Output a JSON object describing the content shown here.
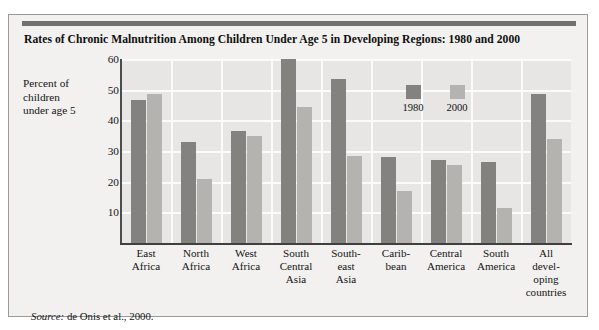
{
  "figure": {
    "title": "Rates of Chronic Malnutrition Among Children Under Age 5 in Developing Regions: 1980 and 2000",
    "y_axis_title_line1": "Percent of",
    "y_axis_title_line2": "children",
    "y_axis_title_line3": "under age 5",
    "source_lead": "Source:",
    "source_text": " de Onis et al., 2000."
  },
  "colors": {
    "series_1980": "#83827f",
    "series_2000": "#b4b3b0",
    "plot_background": "#e7e6e4",
    "figure_background": "#f2f1ef",
    "gridline": "#fbfbfa",
    "axis": "#3f3f3d",
    "top_rule": "#70706e"
  },
  "chart_data": {
    "type": "bar",
    "title": "Rates of Chronic Malnutrition Among Children Under Age 5 in Developing Regions: 1980 and 2000",
    "xlabel": "",
    "ylabel": "Percent of children under age 5",
    "ylim": [
      0,
      60
    ],
    "yticks": [
      10,
      20,
      30,
      40,
      50,
      60
    ],
    "ytick_labels": [
      "10",
      "20",
      "30",
      "40",
      "50",
      "60"
    ],
    "grid": true,
    "legend_position": "inside-upper-right",
    "categories": [
      "East Africa",
      "North Africa",
      "West Africa",
      "South Central Asia",
      "South-east Asia",
      "Caribbean",
      "Central America",
      "South America",
      "All developing countries"
    ],
    "category_label_lines": [
      [
        "East",
        "Africa"
      ],
      [
        "North",
        "Africa"
      ],
      [
        "West",
        "Africa"
      ],
      [
        "South",
        "Central",
        "Asia"
      ],
      [
        "South-",
        "east",
        "Asia"
      ],
      [
        "Carib-",
        "bean"
      ],
      [
        "Central",
        "America"
      ],
      [
        "South",
        "America"
      ],
      [
        "All",
        "devel-",
        "oping",
        "countries"
      ]
    ],
    "series": [
      {
        "name": "1980",
        "color": "#83827f",
        "values": [
          46.5,
          33.0,
          36.5,
          61.0,
          53.5,
          28.0,
          27.0,
          26.5,
          48.5
        ]
      },
      {
        "name": "2000",
        "color": "#b4b3b0",
        "values": [
          48.5,
          21.0,
          35.0,
          44.5,
          28.5,
          17.0,
          25.5,
          11.5,
          34.0
        ]
      }
    ]
  },
  "legend": {
    "items": [
      {
        "label": "1980",
        "color": "#83827f"
      },
      {
        "label": "2000",
        "color": "#b4b3b0"
      }
    ]
  }
}
